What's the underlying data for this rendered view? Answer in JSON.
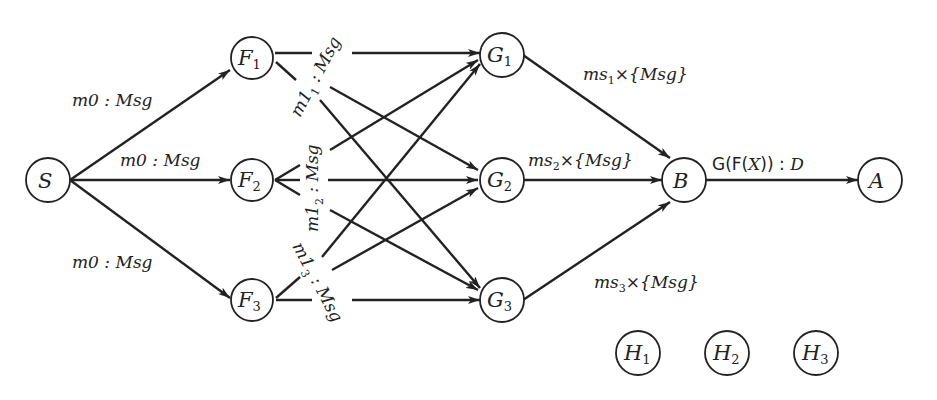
{
  "diagram": {
    "colors": {
      "ink": "#222222",
      "background": "#ffffff"
    },
    "nodes": {
      "S": {
        "letter": "S",
        "sub": ""
      },
      "F1": {
        "letter": "F",
        "sub": "1"
      },
      "F2": {
        "letter": "F",
        "sub": "2"
      },
      "F3": {
        "letter": "F",
        "sub": "3"
      },
      "G1": {
        "letter": "G",
        "sub": "1"
      },
      "G2": {
        "letter": "G",
        "sub": "2"
      },
      "G3": {
        "letter": "G",
        "sub": "3"
      },
      "B": {
        "letter": "B",
        "sub": ""
      },
      "A": {
        "letter": "A",
        "sub": ""
      },
      "H1": {
        "letter": "H",
        "sub": "1"
      },
      "H2": {
        "letter": "H",
        "sub": "2"
      },
      "H3": {
        "letter": "H",
        "sub": "3"
      }
    },
    "edge_labels": {
      "s_f1": "m0 : Msg",
      "s_f2": "m0 : Msg",
      "s_f3": "m0 : Msg",
      "f1": {
        "pre": "m1",
        "sub": "1",
        "post": " : Msg"
      },
      "f2": {
        "pre": "m1",
        "sub": "2",
        "post": " : Msg"
      },
      "f3": {
        "pre": "m1",
        "sub": "3",
        "post": " : Msg"
      },
      "g1_b": {
        "pre": "ms",
        "sub": "1",
        "post": "×{Msg}"
      },
      "g2_b": {
        "pre": "ms",
        "sub": "2",
        "post": "×{Msg}"
      },
      "g3_b": {
        "pre": "ms",
        "sub": "3",
        "post": "×{Msg}"
      },
      "b_a": {
        "func": "G(F(",
        "arg": "X",
        "close": ")) : ",
        "type": "D"
      }
    },
    "edges": [
      "S→F1",
      "S→F2",
      "S→F3",
      "F1→G1",
      "F1→G2",
      "F1→G3",
      "F2→G1",
      "F2→G2",
      "F2→G3",
      "F3→G1",
      "F3→G2",
      "F3→G3",
      "G1→B",
      "G2→B",
      "G3→B",
      "B→A"
    ]
  }
}
